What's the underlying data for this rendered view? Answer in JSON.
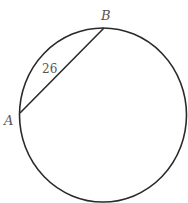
{
  "diagram": {
    "type": "circle-with-chord",
    "colors": {
      "stroke": "#2a2a2a",
      "text": "#555555",
      "background": "#ffffff"
    },
    "circle": {
      "cx": 103,
      "cy": 115,
      "r": 85
    },
    "points": [
      {
        "label": "A",
        "x": 20,
        "y": 113
      },
      {
        "label": "B",
        "x": 104,
        "y": 28
      }
    ],
    "chord": {
      "from": "A",
      "to": "B",
      "length_label": "26"
    }
  }
}
